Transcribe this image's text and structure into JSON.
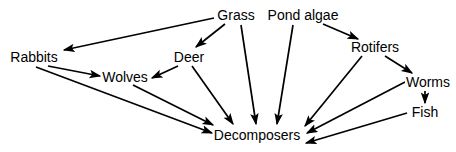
{
  "diagram": {
    "type": "food-web",
    "background_color": "#ffffff",
    "line_color": "#000000",
    "text_color": "#000000",
    "nodes": [
      {
        "id": "grass",
        "label": "Grass",
        "x": 236,
        "y": 15
      },
      {
        "id": "pond-algae",
        "label": "Pond algae",
        "x": 303,
        "y": 15
      },
      {
        "id": "rabbits",
        "label": "Rabbits",
        "x": 34,
        "y": 57
      },
      {
        "id": "deer",
        "label": "Deer",
        "x": 189,
        "y": 57
      },
      {
        "id": "rotifers",
        "label": "Rotifers",
        "x": 375,
        "y": 47
      },
      {
        "id": "wolves",
        "label": "Wolves",
        "x": 125,
        "y": 77
      },
      {
        "id": "worms",
        "label": "Worms",
        "x": 428,
        "y": 82
      },
      {
        "id": "fish",
        "label": "Fish",
        "x": 425,
        "y": 112
      },
      {
        "id": "decomposers",
        "label": "Decomposers",
        "x": 257,
        "y": 135
      }
    ],
    "edges": [
      {
        "from": "grass",
        "to": "rabbits",
        "label": "Grass to Rabbits"
      },
      {
        "from": "grass",
        "to": "deer",
        "label": "Grass to Deer"
      },
      {
        "from": "grass",
        "to": "decomposers",
        "label": "Grass to Decomposers"
      },
      {
        "from": "pond-algae",
        "to": "rotifers",
        "label": "Pond algae to Rotifers"
      },
      {
        "from": "pond-algae",
        "to": "decomposers",
        "label": "Pond algae to Decomposers"
      },
      {
        "from": "rabbits",
        "to": "wolves",
        "label": "Rabbits to Wolves"
      },
      {
        "from": "rabbits",
        "to": "decomposers",
        "label": "Rabbits to Decomposers"
      },
      {
        "from": "deer",
        "to": "wolves",
        "label": "Deer to Wolves"
      },
      {
        "from": "deer",
        "to": "decomposers",
        "label": "Deer to Decomposers"
      },
      {
        "from": "wolves",
        "to": "decomposers",
        "label": "Wolves to Decomposers"
      },
      {
        "from": "rotifers",
        "to": "worms",
        "label": "Rotifers to Worms"
      },
      {
        "from": "rotifers",
        "to": "decomposers",
        "label": "Rotifers to Decomposers"
      },
      {
        "from": "worms",
        "to": "fish",
        "label": "Worms to Fish"
      },
      {
        "from": "worms",
        "to": "decomposers",
        "label": "Worms to Decomposers"
      },
      {
        "from": "fish",
        "to": "decomposers",
        "label": "Fish to Decomposers"
      }
    ]
  }
}
